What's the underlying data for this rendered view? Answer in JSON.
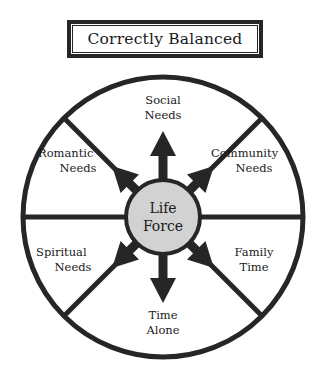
{
  "figure": {
    "title": "Correctly Balanced",
    "kind": "balanced-life-wheel-diagram"
  },
  "colors": {
    "stroke": "#262626",
    "core_fill": "#d2d2d2",
    "background": "#ffffff",
    "text": "#1a1a1a"
  },
  "core": {
    "line1": "Life",
    "line2": "Force"
  },
  "segments": [
    {
      "id": "social",
      "line1": "Social",
      "line2": "Needs",
      "angle_deg": 90,
      "arrow": "up"
    },
    {
      "id": "community",
      "line1": "Community",
      "line2": "Needs",
      "angle_deg": 45,
      "arrow": "up-right"
    },
    {
      "id": "family",
      "line1": "Family",
      "line2": "Time",
      "angle_deg": 315,
      "arrow": "down-right"
    },
    {
      "id": "time-alone",
      "line1": "Time",
      "line2": "Alone",
      "angle_deg": 270,
      "arrow": "down"
    },
    {
      "id": "spiritual",
      "line1": "Spiritual",
      "line2": "Needs",
      "angle_deg": 225,
      "arrow": "down-left"
    },
    {
      "id": "romantic",
      "line1": "Romantic",
      "line2": "Needs",
      "angle_deg": 135,
      "arrow": "up-left"
    }
  ],
  "geometry": {
    "center_x": 163,
    "center_y": 217,
    "outer_radius": 142,
    "core_radius": 37,
    "spoke_count": 8
  }
}
